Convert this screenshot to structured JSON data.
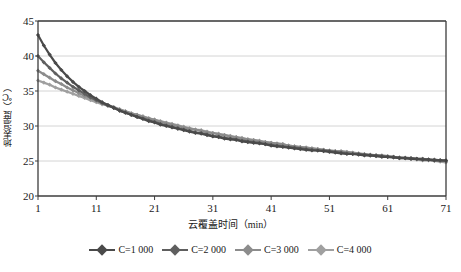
{
  "chart_data": {
    "type": "line",
    "title": "",
    "xlabel": "云覆盖时间（min）",
    "ylabel": "地表温度（℃）",
    "xlim": [
      1,
      71
    ],
    "ylim": [
      20,
      45
    ],
    "xticks": [
      1,
      11,
      21,
      31,
      41,
      51,
      61,
      71
    ],
    "yticks": [
      20,
      25,
      30,
      35,
      40,
      45
    ],
    "grid": "horizontal",
    "legend_position": "bottom",
    "x": [
      1,
      2,
      3,
      4,
      5,
      6,
      7,
      8,
      9,
      10,
      11,
      12,
      13,
      14,
      15,
      16,
      17,
      18,
      19,
      20,
      21,
      22,
      23,
      24,
      25,
      26,
      27,
      28,
      29,
      30,
      31,
      32,
      33,
      34,
      35,
      36,
      37,
      38,
      39,
      40,
      41,
      42,
      43,
      44,
      45,
      46,
      47,
      48,
      49,
      50,
      51,
      52,
      53,
      54,
      55,
      56,
      57,
      58,
      59,
      60,
      61,
      62,
      63,
      64,
      65,
      66,
      67,
      68,
      69,
      70,
      71
    ],
    "series": [
      {
        "name": "C=1 000",
        "color": "#4a4a4a",
        "values": [
          43.0,
          41.5,
          40.2,
          39.0,
          38.0,
          37.1,
          36.3,
          35.6,
          35.0,
          34.4,
          33.9,
          33.4,
          33.0,
          32.6,
          32.2,
          31.9,
          31.6,
          31.3,
          31.0,
          30.7,
          30.5,
          30.2,
          30.0,
          29.8,
          29.6,
          29.4,
          29.2,
          29.0,
          28.9,
          28.7,
          28.5,
          28.4,
          28.2,
          28.1,
          28.0,
          27.8,
          27.7,
          27.6,
          27.5,
          27.4,
          27.2,
          27.1,
          27.0,
          26.9,
          26.8,
          26.7,
          26.6,
          26.5,
          26.5,
          26.4,
          26.3,
          26.2,
          26.1,
          26.0,
          26.0,
          25.9,
          25.8,
          25.8,
          25.7,
          25.6,
          25.6,
          25.5,
          25.4,
          25.4,
          25.3,
          25.3,
          25.2,
          25.2,
          25.1,
          25.1,
          25.1
        ]
      },
      {
        "name": "C=2 000",
        "color": "#5f5f5f",
        "values": [
          40.0,
          39.1,
          38.3,
          37.5,
          36.8,
          36.2,
          35.6,
          35.1,
          34.6,
          34.1,
          33.7,
          33.3,
          32.9,
          32.6,
          32.2,
          31.9,
          31.6,
          31.3,
          31.1,
          30.8,
          30.6,
          30.3,
          30.1,
          29.9,
          29.7,
          29.5,
          29.3,
          29.1,
          29.0,
          28.8,
          28.6,
          28.5,
          28.3,
          28.2,
          28.1,
          27.9,
          27.8,
          27.7,
          27.6,
          27.4,
          27.3,
          27.2,
          27.1,
          27.0,
          26.9,
          26.8,
          26.7,
          26.6,
          26.5,
          26.5,
          26.4,
          26.3,
          26.2,
          26.1,
          26.0,
          26.0,
          25.9,
          25.8,
          25.8,
          25.7,
          25.6,
          25.6,
          25.5,
          25.4,
          25.4,
          25.3,
          25.3,
          25.2,
          25.2,
          25.1,
          25.0
        ]
      },
      {
        "name": "C=3 000",
        "color": "#8c8c8c",
        "values": [
          37.9,
          37.4,
          36.9,
          36.4,
          36.0,
          35.5,
          35.1,
          34.7,
          34.3,
          34.0,
          33.6,
          33.3,
          33.0,
          32.7,
          32.4,
          32.1,
          31.8,
          31.6,
          31.3,
          31.1,
          30.9,
          30.6,
          30.4,
          30.2,
          30.0,
          29.8,
          29.6,
          29.5,
          29.3,
          29.1,
          29.0,
          28.8,
          28.7,
          28.5,
          28.4,
          28.2,
          28.1,
          28.0,
          27.8,
          27.7,
          27.6,
          27.5,
          27.4,
          27.2,
          27.1,
          27.0,
          26.9,
          26.8,
          26.7,
          26.6,
          26.5,
          26.4,
          26.4,
          26.3,
          26.2,
          26.1,
          26.0,
          25.9,
          25.8,
          25.8,
          25.7,
          25.6,
          25.5,
          25.5,
          25.4,
          25.3,
          25.3,
          25.2,
          25.1,
          25.1,
          25.0
        ]
      },
      {
        "name": "C=4 000",
        "color": "#a0a0a0",
        "values": [
          36.5,
          36.2,
          35.9,
          35.5,
          35.2,
          34.9,
          34.6,
          34.3,
          34.0,
          33.7,
          33.4,
          33.1,
          32.9,
          32.6,
          32.3,
          32.1,
          31.8,
          31.6,
          31.4,
          31.1,
          30.9,
          30.7,
          30.5,
          30.3,
          30.1,
          29.9,
          29.7,
          29.5,
          29.4,
          29.2,
          29.0,
          28.9,
          28.7,
          28.6,
          28.4,
          28.3,
          28.1,
          28.0,
          27.9,
          27.7,
          27.6,
          27.5,
          27.4,
          27.2,
          27.1,
          27.0,
          26.9,
          26.8,
          26.7,
          26.6,
          26.5,
          26.4,
          26.3,
          26.2,
          26.1,
          26.0,
          25.9,
          25.8,
          25.8,
          25.7,
          25.6,
          25.5,
          25.4,
          25.4,
          25.3,
          25.2,
          25.1,
          25.1,
          25.0,
          24.9,
          24.8
        ]
      }
    ]
  },
  "axes": {
    "ylabel": "地表温度（℃）",
    "xlabel": "云覆盖时间（min）",
    "ytick_labels": [
      "45",
      "40",
      "35",
      "30",
      "25",
      "20"
    ],
    "xtick_labels": [
      "1",
      "11",
      "21",
      "31",
      "41",
      "51",
      "61",
      "71"
    ]
  },
  "legend": {
    "items": [
      {
        "label": "C=1 000",
        "color": "#4a4a4a"
      },
      {
        "label": "C=2 000",
        "color": "#5f5f5f"
      },
      {
        "label": "C=3 000",
        "color": "#8c8c8c"
      },
      {
        "label": "C=4 000",
        "color": "#a0a0a0"
      }
    ]
  },
  "style": {
    "plot_border_color": "#3c3c3c",
    "grid_color": "#d4d4d4",
    "background": "#ffffff",
    "text_color": "#1a1a1a"
  }
}
